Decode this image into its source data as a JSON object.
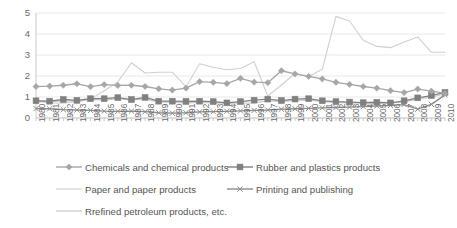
{
  "chart_data": {
    "type": "line",
    "title": "",
    "xlabel": "",
    "ylabel": "",
    "ylim": [
      0,
      5
    ],
    "yticks": [
      0,
      1,
      2,
      3,
      4,
      5
    ],
    "grid": true,
    "legend_position": "bottom",
    "x": [
      1980,
      1981,
      1982,
      1983,
      1984,
      1985,
      1986,
      1987,
      1988,
      1989,
      1990,
      1991,
      1992,
      1993,
      1994,
      1995,
      1996,
      1997,
      1998,
      1999,
      2000,
      2001,
      2002,
      2003,
      2004,
      2005,
      2006,
      2007,
      2008,
      2009,
      2010
    ],
    "categories": [
      "1980",
      "1981",
      "1982",
      "1983",
      "1984",
      "1985",
      "1986",
      "1987",
      "1988",
      "1989",
      "1990",
      "1991",
      "1992",
      "1993",
      "1994",
      "1995",
      "1996",
      "1997",
      "1998",
      "1999",
      "2000",
      "2001",
      "2002",
      "2003",
      "2004",
      "2005",
      "2006",
      "2007",
      "2008",
      "2009",
      "2010"
    ],
    "series": [
      {
        "name": "Chemicals and chemical products",
        "marker": "diamond",
        "color": "#a6a6a6",
        "values": [
          1.5,
          1.52,
          1.56,
          1.63,
          1.49,
          1.59,
          1.55,
          1.56,
          1.5,
          1.39,
          1.33,
          1.42,
          1.73,
          1.7,
          1.64,
          1.89,
          1.71,
          1.68,
          2.25,
          2.1,
          1.98,
          1.86,
          1.7,
          1.6,
          1.5,
          1.42,
          1.3,
          1.21,
          1.38,
          1.28,
          1.17
        ]
      },
      {
        "name": "Rubber and plastics products",
        "marker": "square",
        "color": "#808080",
        "values": [
          0.82,
          0.8,
          0.88,
          0.84,
          0.92,
          0.92,
          0.97,
          0.88,
          0.98,
          0.8,
          0.8,
          0.79,
          0.8,
          0.78,
          0.72,
          0.78,
          0.85,
          0.9,
          0.83,
          0.9,
          0.92,
          0.82,
          0.78,
          0.76,
          0.73,
          0.75,
          0.72,
          0.82,
          0.96,
          1.07,
          1.22
        ]
      },
      {
        "name": "Paper and paper products",
        "marker": "none",
        "color": "#d0d0d0",
        "values": [
          0.85,
          0.72,
          0.7,
          0.78,
          0.9,
          1.3,
          1.72,
          2.63,
          2.14,
          2.18,
          2.18,
          1.48,
          2.58,
          2.42,
          2.3,
          2.36,
          2.68,
          1.05,
          1.57,
          2.12,
          1.98,
          2.32,
          4.84,
          4.62,
          3.7,
          3.41,
          3.35,
          3.62,
          3.86,
          3.13,
          3.13
        ]
      },
      {
        "name": "Printing and publishing",
        "marker": "x",
        "color": "#8c8c8c",
        "values": [
          0.45,
          0.44,
          0.4,
          0.38,
          0.36,
          0.33,
          0.32,
          0.33,
          0.3,
          0.25,
          0.23,
          0.25,
          0.29,
          0.3,
          0.32,
          0.34,
          0.36,
          0.38,
          0.42,
          0.44,
          0.46,
          0.48,
          0.5,
          0.52,
          0.54,
          0.57,
          0.6,
          0.64,
          0.42,
          0.65,
          1.1
        ]
      },
      {
        "name": "Rrefined petroleum products, etc.",
        "marker": "none",
        "color": "#c8c8c8",
        "values": [
          0.78,
          0.76,
          0.82,
          0.8,
          0.88,
          0.85,
          0.92,
          0.86,
          0.9,
          0.76,
          0.74,
          0.72,
          0.74,
          0.72,
          0.7,
          0.7,
          0.72,
          0.82,
          0.78,
          0.84,
          0.86,
          0.78,
          0.74,
          0.72,
          0.7,
          0.72,
          0.7,
          0.78,
          0.88,
          1.0,
          1.14
        ]
      }
    ]
  },
  "axes": {
    "y_tick_labels": [
      "5",
      "4",
      "3",
      "2",
      "1",
      "0"
    ],
    "x_tick_labels": [
      "1980",
      "1981",
      "1982",
      "1983",
      "1984",
      "1985",
      "1986",
      "1987",
      "1988",
      "1989",
      "1990",
      "1991",
      "1992",
      "1993",
      "1994",
      "1995",
      "1996",
      "1997",
      "1998",
      "1999",
      "2000",
      "2001",
      "2002",
      "2003",
      "2004",
      "2005",
      "2006",
      "2007",
      "2008",
      "2009",
      "2010"
    ]
  },
  "legend": {
    "rows": [
      [
        {
          "label": "Chemicals and chemical products",
          "marker": "diamond",
          "color": "#a6a6a6"
        },
        {
          "label": "Rubber and plastics products",
          "marker": "square",
          "color": "#808080"
        }
      ],
      [
        {
          "label": "Paper and paper products",
          "marker": "none",
          "color": "#d0d0d0"
        },
        {
          "label": "Printing and publishing",
          "marker": "x",
          "color": "#8c8c8c"
        }
      ],
      [
        {
          "label": "Rrefined petroleum products, etc.",
          "marker": "none",
          "color": "#c8c8c8"
        }
      ]
    ]
  },
  "colors": {
    "gridline": "#e8e8e8",
    "axis": "#c9c9c9",
    "text": "#6b6b6b",
    "background": "#ffffff"
  }
}
